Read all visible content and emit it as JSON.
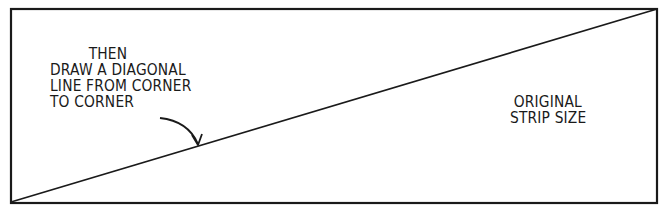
{
  "illustration": {
    "instruction": {
      "lines": [
        "THEN",
        "DRAW A DIAGONAL",
        "LINE FROM CORNER",
        "TO CORNER"
      ]
    },
    "strip_label": {
      "lines": [
        "ORIGINAL",
        "STRIP SIZE"
      ]
    },
    "colors": {
      "ink": "#1a1a1a",
      "paper": "#ffffff"
    }
  }
}
